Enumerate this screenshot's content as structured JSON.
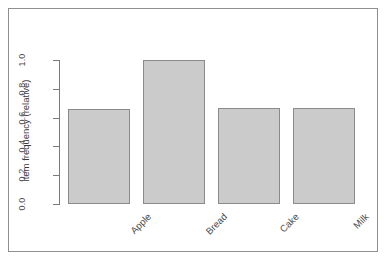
{
  "chart_data": {
    "type": "bar",
    "title": "",
    "subtitle": "",
    "xlabel": "",
    "ylabel": "item frequency (relative)",
    "categories": [
      "Apple",
      "Bread",
      "Cake",
      "Milk"
    ],
    "values": [
      0.66,
      1.0,
      0.67,
      0.67
    ],
    "series": [
      {
        "name": "item frequency (relative)",
        "values": [
          0.66,
          1.0,
          0.67,
          0.67
        ]
      }
    ],
    "ylim": [
      0.0,
      1.0
    ],
    "y_ticks": [
      "0.0",
      "0.2",
      "0.4",
      "0.6",
      "0.8",
      "1.0"
    ],
    "y_tick_values": [
      0.0,
      0.2,
      0.4,
      0.6,
      0.8,
      1.0
    ],
    "grid": false,
    "legend": false,
    "legend_position": "none",
    "x_tick_label_rotation": "-45",
    "y_tick_label_rotation": "-90",
    "bar_fill_color": "#cbcbcb",
    "bar_border_color": "#8a8a8a",
    "axis_color": "#7a7a7a",
    "frame_border_color": "#8f8f8f",
    "background_color": "#ffffff",
    "text_color": "#4a4a4a"
  }
}
